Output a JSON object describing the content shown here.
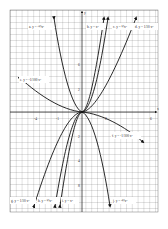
{
  "figure": {
    "axes": {
      "x_label": "x",
      "y_label": "y"
    },
    "x_ticks": [
      {
        "label": "-4",
        "x": 36
      },
      {
        "label": "-1",
        "x": 58
      },
      {
        "label": "2",
        "x": 106
      },
      {
        "label": "6",
        "x": 152
      }
    ],
    "y_ticks": [
      {
        "label": "6",
        "y": 64
      },
      {
        "label": "2",
        "y": 89
      },
      {
        "label": "2",
        "y": 136
      },
      {
        "label": "4",
        "y": 160
      },
      {
        "label": "8",
        "y": 185
      }
    ],
    "curve_labels": [
      {
        "id": "a",
        "text": "a. y = -½x³",
        "x": 30,
        "y": 27
      },
      {
        "id": "b",
        "text": "b. y = x³",
        "x": 88,
        "y": 27
      },
      {
        "id": "c",
        "text": "c. y = ½x³",
        "x": 114,
        "y": 27
      },
      {
        "id": "d",
        "text": "d. y = 1/10 x³",
        "x": 136,
        "y": 27
      },
      {
        "id": "e",
        "text": "e. y = -1/100 x³",
        "x": 20,
        "y": 80
      },
      {
        "id": "f",
        "text": "f. y = -1/100 x³",
        "x": 113,
        "y": 136
      },
      {
        "id": "g",
        "text": "g. y = 1/10 x³",
        "x": 12,
        "y": 201
      },
      {
        "id": "h",
        "text": "h. y = ½x³",
        "x": 38,
        "y": 201
      },
      {
        "id": "i",
        "text": "i. y = x³",
        "x": 62,
        "y": 201
      },
      {
        "id": "j",
        "text": "j. y = -½x³",
        "x": 113,
        "y": 201
      }
    ]
  }
}
